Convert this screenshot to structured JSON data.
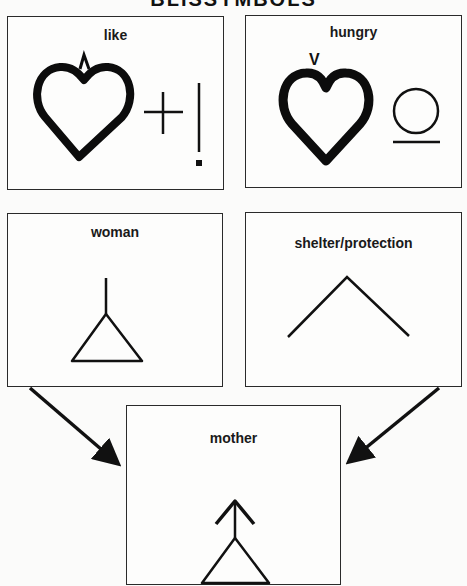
{
  "title": "BLISSYMBOLS",
  "panels": {
    "like": {
      "label": "like"
    },
    "hungry": {
      "label": "hungry",
      "mark": "V"
    },
    "woman": {
      "label": "woman"
    },
    "shelter": {
      "label": "shelter/protection"
    },
    "mother": {
      "label": "mother"
    }
  },
  "connections": [
    {
      "from": "woman",
      "to": "mother"
    },
    {
      "from": "shelter/protection",
      "to": "mother"
    }
  ]
}
